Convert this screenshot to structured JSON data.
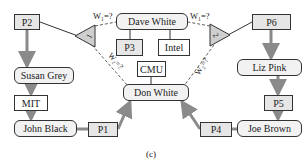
{
  "diagram": {
    "caption": "(c)",
    "papers": [
      {
        "id": "P1",
        "label": "P1"
      },
      {
        "id": "P2",
        "label": "P2"
      },
      {
        "id": "P3",
        "label": "P3"
      },
      {
        "id": "P4",
        "label": "P4"
      },
      {
        "id": "P5",
        "label": "P5"
      },
      {
        "id": "P6",
        "label": "P6"
      }
    ],
    "people": [
      {
        "id": "susan",
        "label": "Susan Grey"
      },
      {
        "id": "john",
        "label": "John Black"
      },
      {
        "id": "dave",
        "label": "Dave White"
      },
      {
        "id": "don",
        "label": "Don White"
      },
      {
        "id": "liz",
        "label": "Liz Pink"
      },
      {
        "id": "joe",
        "label": "Joe Brown"
      }
    ],
    "organizations": [
      {
        "id": "mit",
        "label": "MIT"
      },
      {
        "id": "intel",
        "label": "Intel"
      },
      {
        "id": "cmu",
        "label": "CMU"
      }
    ],
    "factors": [
      {
        "id": "f1",
        "label": "1"
      },
      {
        "id": "f2",
        "label": "2"
      }
    ],
    "weights": {
      "w1_left": "W₁=?",
      "w2_left": "W₂=?",
      "w1_right": "W₁=?",
      "w2_right": "W₂=?"
    },
    "colors": {
      "paper_fill": "#e6e6e6",
      "person_fill": "#f2f2f2",
      "triangle_fill": "#cfcfcf",
      "edge_thick": "#8a8a8a",
      "edge_thin": "#333333"
    }
  }
}
